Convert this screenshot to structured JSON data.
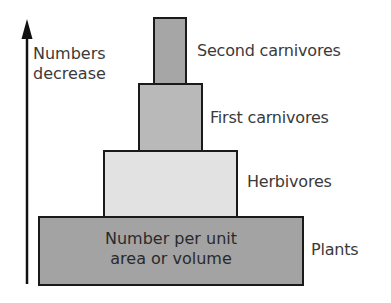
{
  "diagram": {
    "type": "pyramid of numbers",
    "axis": {
      "label_line1": "Numbers",
      "label_line2": "decrease",
      "direction": "up"
    },
    "levels": [
      {
        "name": "Second carnivores",
        "fill": "#a6a6a6"
      },
      {
        "name": "First carnivores",
        "fill": "#b9b9b9"
      },
      {
        "name": "Herbivores",
        "fill": "#e2e2e2"
      },
      {
        "name": "Plants",
        "fill": "#a3a3a3"
      }
    ],
    "base_annotation": {
      "line1": "Number per unit",
      "line2": "area or volume",
      "arrows": "left-right"
    }
  }
}
